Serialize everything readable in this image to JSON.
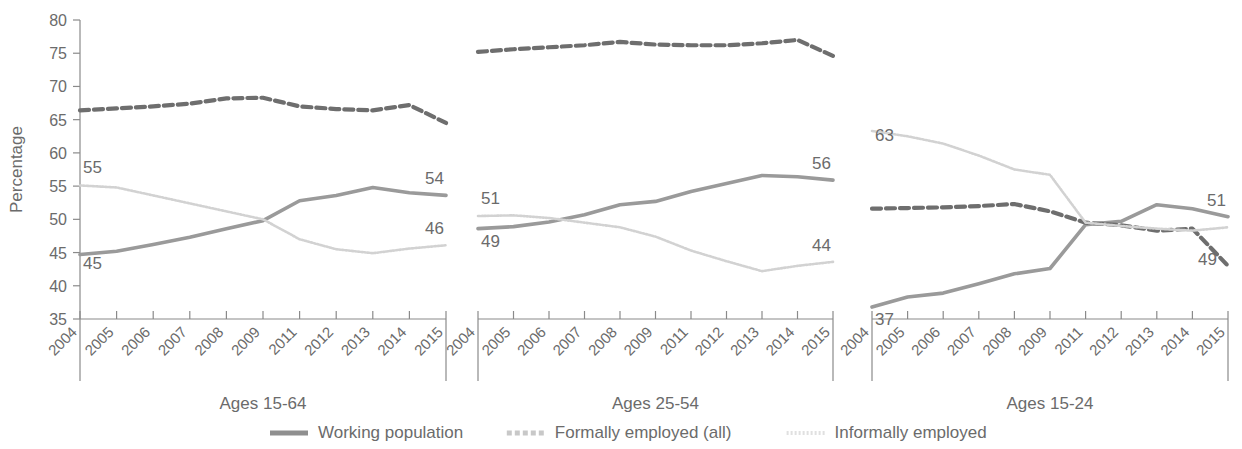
{
  "chart_data": {
    "type": "line",
    "title": "",
    "xlabel": "",
    "ylabel": "Percentage",
    "ylim": [
      35,
      80
    ],
    "yticks": [
      35,
      40,
      45,
      50,
      55,
      60,
      65,
      70,
      75,
      80
    ],
    "grid": false,
    "legend_position": "bottom",
    "categories": [
      "2004",
      "2005",
      "2006",
      "2007",
      "2008",
      "2009",
      "2011",
      "2012",
      "2013",
      "2014",
      "2015"
    ],
    "panels": [
      {
        "name": "Ages 15-64",
        "series": [
          {
            "name": "Working population",
            "style": "solid",
            "color": "#9a9a9a",
            "values": [
              44.7,
              45.2,
              46.2,
              47.3,
              48.6,
              49.8,
              52.8,
              53.6,
              54.8,
              54.0,
              53.6
            ],
            "start_label": "45",
            "end_label": "54"
          },
          {
            "name": "Formally employed (all)",
            "style": "dashed",
            "color": "#6e6e6e",
            "values": [
              66.4,
              66.7,
              67.0,
              67.4,
              68.2,
              68.3,
              67.0,
              66.6,
              66.4,
              67.2,
              64.5
            ],
            "start_label": "",
            "end_label": ""
          },
          {
            "name": "Informally employed",
            "style": "dotted",
            "color": "#d2d2d2",
            "values": [
              55.1,
              54.8,
              53.6,
              52.4,
              51.2,
              50.0,
              47.0,
              45.5,
              44.9,
              45.6,
              46.1
            ],
            "start_label": "55",
            "end_label": "46"
          }
        ]
      },
      {
        "name": "Ages 25-54",
        "series": [
          {
            "name": "Working population",
            "style": "solid",
            "color": "#9a9a9a",
            "values": [
              48.6,
              48.9,
              49.6,
              50.7,
              52.2,
              52.7,
              54.2,
              55.4,
              56.6,
              56.4,
              55.9
            ],
            "start_label": "49",
            "end_label": "56"
          },
          {
            "name": "Formally employed (all)",
            "style": "dashed",
            "color": "#6e6e6e",
            "values": [
              75.2,
              75.6,
              75.9,
              76.2,
              76.7,
              76.3,
              76.2,
              76.2,
              76.5,
              77.0,
              74.6
            ],
            "start_label": "",
            "end_label": ""
          },
          {
            "name": "Informally employed",
            "style": "dotted",
            "color": "#d2d2d2",
            "values": [
              50.5,
              50.6,
              50.2,
              49.5,
              48.8,
              47.4,
              45.3,
              43.7,
              42.2,
              43.0,
              43.6
            ],
            "start_label": "51",
            "end_label": "44"
          }
        ]
      },
      {
        "name": "Ages 15-24",
        "series": [
          {
            "name": "Working population",
            "style": "solid",
            "color": "#9a9a9a",
            "values": [
              36.8,
              38.3,
              38.9,
              40.3,
              41.8,
              42.6,
              49.2,
              49.7,
              52.2,
              51.6,
              50.4
            ],
            "start_label": "37",
            "end_label": "51"
          },
          {
            "name": "Formally employed (all)",
            "style": "dashed",
            "color": "#6e6e6e",
            "values": [
              51.6,
              51.7,
              51.8,
              52.0,
              52.3,
              51.2,
              49.5,
              49.1,
              48.3,
              48.6,
              43.0
            ],
            "start_label": "",
            "end_label": "49"
          },
          {
            "name": "Informally employed",
            "style": "dotted",
            "color": "#d2d2d2",
            "values": [
              63.3,
              62.5,
              61.4,
              59.6,
              57.5,
              56.7,
              49.5,
              49.0,
              48.6,
              48.3,
              48.8
            ],
            "start_label": "63",
            "end_label": ""
          }
        ]
      }
    ],
    "legend": [
      {
        "label": "Working population",
        "style": "solid",
        "color": "#8f8f8f"
      },
      {
        "label": "Formally employed (all)",
        "style": "dashed",
        "color": "#c8c8c8"
      },
      {
        "label": "Informally employed",
        "style": "dotted",
        "color": "#e0e0e0"
      }
    ]
  }
}
